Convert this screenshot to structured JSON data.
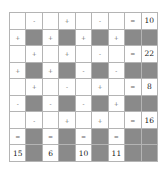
{
  "puzzle": {
    "colors": {
      "blocked": "#8a8a8a",
      "border": "#b4b4b4",
      "cell": "#ffffff"
    },
    "rows": [
      [
        "",
        "-",
        "",
        "+",
        "",
        "-",
        "",
        "=",
        "10"
      ],
      [
        "+",
        "#",
        "+",
        "#",
        "+",
        "#",
        "+",
        "#",
        "#"
      ],
      [
        "",
        "+",
        "",
        "+",
        "",
        "-",
        "",
        "=",
        "22"
      ],
      [
        "+",
        "#",
        "+",
        "#",
        "-",
        "#",
        "-",
        "#",
        "#"
      ],
      [
        "",
        "+",
        "",
        "-",
        "",
        "+",
        "",
        "=",
        "8"
      ],
      [
        "-",
        "#",
        "-",
        "#",
        "-",
        "#",
        "+",
        "#",
        "#"
      ],
      [
        "",
        "-",
        "",
        "+",
        "",
        "+",
        "",
        "=",
        "16"
      ],
      [
        "=",
        "#",
        "=",
        "#",
        "=",
        "#",
        "=",
        "#",
        "#"
      ],
      [
        "15",
        "#",
        "6",
        "#",
        "10",
        "#",
        "11",
        "#",
        "#"
      ]
    ]
  }
}
